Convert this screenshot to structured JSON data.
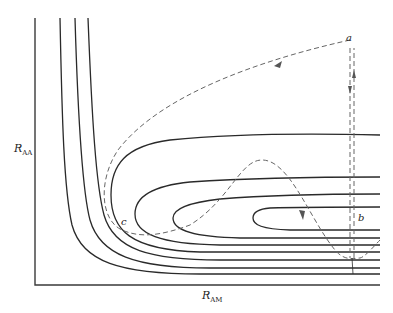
{
  "diagram": {
    "type": "potential energy surface contour plot with reaction trajectory",
    "axes": {
      "y_label": {
        "main": "R",
        "sub": "AA"
      },
      "x_label": {
        "main": "R",
        "sub": "AM"
      }
    },
    "points": [
      {
        "id": "a",
        "label": "a"
      },
      {
        "id": "b",
        "label": "b"
      },
      {
        "id": "c",
        "label": "c"
      }
    ],
    "contours": {
      "count_l_shaped": 3,
      "count_u_shaped": 4
    },
    "trajectory": {
      "style": "dashed",
      "path": "a → down → back up → toward c → over barrier → b",
      "arrows": 4
    },
    "colors": {
      "contour": "#2a2a2a",
      "trajectory": "#666666",
      "background": "#ffffff"
    }
  }
}
